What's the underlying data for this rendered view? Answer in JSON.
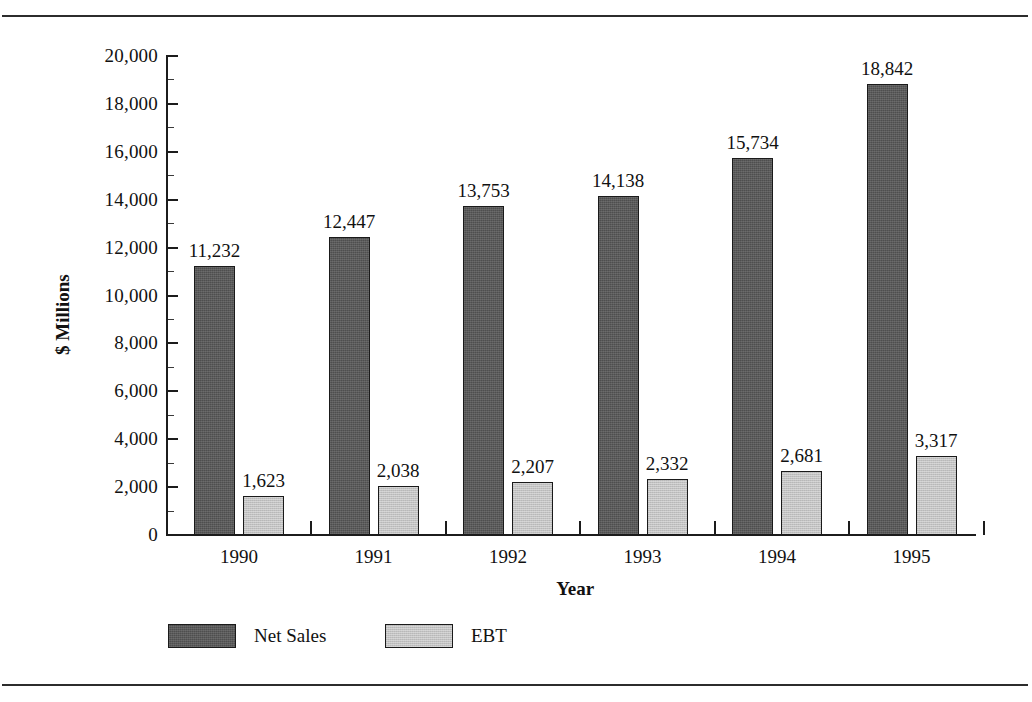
{
  "chart_data": {
    "type": "bar",
    "title": "",
    "xlabel": "Year",
    "ylabel": "$ Millions",
    "categories": [
      "1990",
      "1991",
      "1992",
      "1993",
      "1994",
      "1995"
    ],
    "series": [
      {
        "name": "Net Sales",
        "color": "#4e4e4e",
        "values": [
          11232,
          12447,
          13753,
          14138,
          15734,
          18842
        ],
        "labels": [
          "11,232",
          "12,447",
          "13,753",
          "14,138",
          "15,734",
          "18,842"
        ]
      },
      {
        "name": "EBT",
        "color": "#c2c2c2",
        "values": [
          1623,
          2038,
          2207,
          2332,
          2681,
          3317
        ],
        "labels": [
          "1,623",
          "2,038",
          "2,207",
          "2,332",
          "2,681",
          "3,317"
        ]
      }
    ],
    "ylim": [
      0,
      20000
    ],
    "ytick_values": [
      0,
      2000,
      4000,
      6000,
      8000,
      10000,
      12000,
      14000,
      16000,
      18000,
      20000
    ],
    "ytick_labels": [
      "0",
      "2,000",
      "4,000",
      "6,000",
      "8,000",
      "10,000",
      "12,000",
      "14,000",
      "16,000",
      "18,000",
      "20,000"
    ],
    "ytick_minor_step": 1000,
    "grid": false,
    "legend_position": "bottom"
  },
  "axes": {
    "y_title": "$ Millions",
    "x_title": "Year"
  },
  "legend": {
    "items": [
      {
        "label": "Net Sales",
        "swatch": "dark-gray-swatch"
      },
      {
        "label": "EBT",
        "swatch": "light-gray-swatch"
      }
    ]
  }
}
